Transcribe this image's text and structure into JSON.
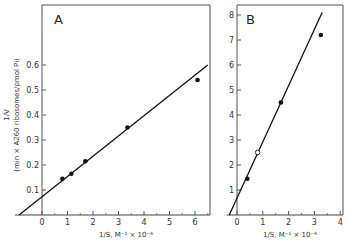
{
  "chart_data": [
    {
      "type": "scatter",
      "panel_label": "A",
      "title": "",
      "xlabel": "1/S, M⁻¹ × 10⁻⁶",
      "ylabel": "1/V",
      "ylabel_units": "(min × A260 ribosomes/pmol Pi)",
      "xlim": [
        -1,
        6.5
      ],
      "ylim": [
        0,
        0.78
      ],
      "xticks": [
        "0",
        "1",
        "2",
        "3",
        "4",
        "5",
        "6"
      ],
      "yticks": [
        "0.1",
        "0.2",
        "0.3",
        "0.4",
        "0.5",
        "0.6"
      ],
      "grid": false,
      "series": [
        {
          "name": "data",
          "marker": "filled-circle",
          "x": [
            0.8,
            1.15,
            1.7,
            3.35,
            6.1
          ],
          "y": [
            0.145,
            0.165,
            0.215,
            0.35,
            0.54
          ]
        }
      ],
      "fit_line": {
        "x": [
          -0.9,
          6.5
        ],
        "y": [
          0.0,
          0.6
        ]
      }
    },
    {
      "type": "scatter",
      "panel_label": "B",
      "title": "",
      "xlabel": "1/S, M⁻¹ × 10⁻⁶",
      "ylabel": "",
      "xlim": [
        -0.4,
        4
      ],
      "ylim": [
        0,
        8.5
      ],
      "xticks": [
        "0",
        "1",
        "2",
        "3",
        "4"
      ],
      "yticks": [
        "1",
        "2",
        "3",
        "4",
        "5",
        "6",
        "7",
        "8"
      ],
      "grid": false,
      "series": [
        {
          "name": "data",
          "marker": "filled-circle",
          "x": [
            0.4,
            1.7,
            3.25
          ],
          "y": [
            1.45,
            4.5,
            7.2
          ]
        },
        {
          "name": "data-open",
          "marker": "open-circle",
          "x": [
            0.8
          ],
          "y": [
            2.5
          ]
        }
      ],
      "fit_line": {
        "x": [
          -0.3,
          3.3
        ],
        "y": [
          0.0,
          8.1
        ]
      }
    }
  ]
}
